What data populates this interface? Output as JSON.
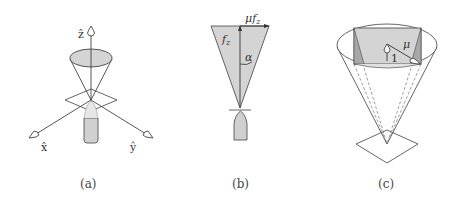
{
  "figure": {
    "panels": [
      {
        "id": "a",
        "caption": "(a)",
        "axis_labels": {
          "z": "ẑ",
          "x": "x̂",
          "y": "ŷ"
        },
        "description": "Cone of thrust directions above a contact plane with 3D axes"
      },
      {
        "id": "b",
        "caption": "(b)",
        "labels": {
          "normal_force": "f",
          "normal_force_sub": "z",
          "friction": "μf",
          "friction_sub": "z",
          "angle": "α"
        },
        "description": "Cross-section of friction cone with normal force and friction magnitude"
      },
      {
        "id": "c",
        "caption": "(c)",
        "labels": {
          "unit": "1",
          "mu": "μ"
        },
        "description": "Friction cone with inscribed pyramid approximation"
      }
    ],
    "colors": {
      "line": "#444444",
      "fill_gray": "#d4d4d4",
      "fill_dark": "#a8a8a8",
      "background": "#ffffff"
    }
  }
}
